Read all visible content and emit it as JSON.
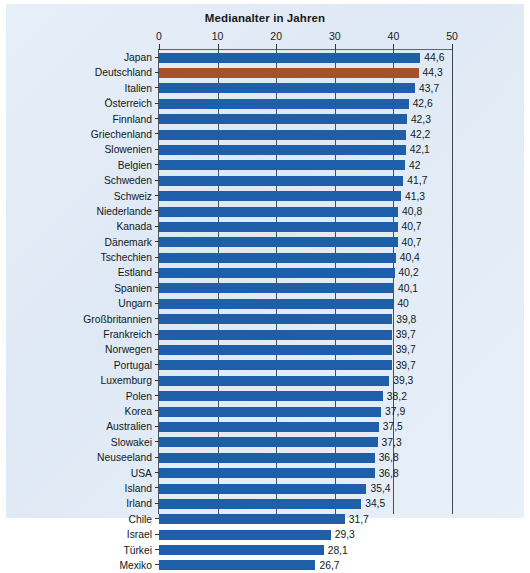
{
  "chart_data": {
    "type": "bar",
    "orientation": "horizontal",
    "title": "Medianalter in Jahren",
    "xlabel": "",
    "ylabel": "",
    "xlim": [
      0,
      50
    ],
    "xticks": [
      0,
      10,
      20,
      30,
      40,
      50
    ],
    "grid": true,
    "grid_axis": "x",
    "legend": "none",
    "highlight_category": "Deutschland",
    "colors": {
      "bar": "#1f5fa9",
      "highlight_bar": "#a8502c",
      "background": "#e2ecf7",
      "axis": "#3d4852",
      "text": "#111820"
    },
    "categories": [
      "Japan",
      "Deutschland",
      "Italien",
      "Österreich",
      "Finnland",
      "Griechenland",
      "Slowenien",
      "Belgien",
      "Schweden",
      "Schweiz",
      "Niederlande",
      "Kanada",
      "Dänemark",
      "Tschechien",
      "Estland",
      "Spanien",
      "Ungarn",
      "Großbritannien",
      "Frankreich",
      "Norwegen",
      "Portugal",
      "Luxemburg",
      "Polen",
      "Korea",
      "Australien",
      "Slowakei",
      "Neuseeland",
      "USA",
      "Island",
      "Irland",
      "Chile",
      "Israel",
      "Türkei",
      "Mexiko"
    ],
    "values": [
      44.6,
      44.3,
      43.7,
      42.6,
      42.3,
      42.2,
      42.1,
      42.0,
      41.7,
      41.3,
      40.8,
      40.7,
      40.7,
      40.4,
      40.2,
      40.1,
      40.0,
      39.8,
      39.7,
      39.7,
      39.7,
      39.3,
      38.2,
      37.9,
      37.5,
      37.3,
      36.8,
      36.8,
      35.4,
      34.5,
      31.7,
      29.3,
      28.1,
      26.7
    ],
    "value_labels": [
      "44,6",
      "44,3",
      "43,7",
      "42,6",
      "42,3",
      "42,2",
      "42,1",
      "42",
      "41,7",
      "41,3",
      "40,8",
      "40,7",
      "40,7",
      "40,4",
      "40,2",
      "40,1",
      "40",
      "39,8",
      "39,7",
      "39,7",
      "39,7",
      "39,3",
      "38,2",
      "37,9",
      "37,5",
      "37,3",
      "36,8",
      "36,8",
      "35,4",
      "34,5",
      "31,7",
      "29,3",
      "28,1",
      "26,7"
    ],
    "tick_labels": [
      "0",
      "10",
      "20",
      "30",
      "40",
      "50"
    ]
  }
}
